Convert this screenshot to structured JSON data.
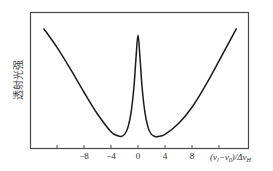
{
  "chart_data": {
    "type": "line",
    "title": "",
    "xlabel": "(ν_l − ν_0)/Δν_H",
    "xlabel_parts": {
      "open": "(",
      "nu1": "ν",
      "sub1": "l",
      "minus": "−",
      "nu0": "ν",
      "sub0": "0",
      "close": ")/Δ",
      "nuH": "ν",
      "subH": "H"
    },
    "ylabel": "透射光强",
    "xlim": [
      -14,
      16.5
    ],
    "ylim": [
      0,
      1
    ],
    "grid": false,
    "legend": null,
    "x_ticks": [
      -12,
      -8,
      -4,
      0,
      4,
      8,
      12
    ],
    "x_tick_labels": [
      "",
      "−8",
      "−4",
      "0",
      "4",
      "8",
      ""
    ],
    "series": [
      {
        "name": "transmitted intensity",
        "color": "#1a1a1a",
        "x": [
          -14,
          -12,
          -10,
          -8,
          -6,
          -4,
          -3,
          -2.5,
          -2,
          -1.5,
          -1,
          -0.6,
          -0.3,
          0,
          0.3,
          0.6,
          1,
          1.5,
          2,
          2.5,
          3,
          4,
          6,
          8,
          10,
          12,
          14.6
        ],
        "y": [
          0.88,
          0.74,
          0.58,
          0.41,
          0.25,
          0.12,
          0.09,
          0.085,
          0.1,
          0.15,
          0.27,
          0.45,
          0.66,
          0.83,
          0.66,
          0.45,
          0.27,
          0.15,
          0.1,
          0.085,
          0.085,
          0.1,
          0.18,
          0.3,
          0.46,
          0.64,
          0.88
        ]
      }
    ],
    "annotations": []
  },
  "colors": {
    "axis": "#4a4a4a",
    "curve": "#1a1a1a",
    "background": "#ffffff"
  }
}
